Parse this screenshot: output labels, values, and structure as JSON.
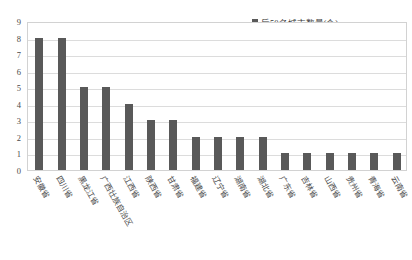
{
  "legend": {
    "entries": [
      {
        "label": "后50名城市数量(个)",
        "color": "#595959",
        "marker": "square-swatch"
      }
    ]
  },
  "axes": {
    "y_ticks": [
      "0",
      "1",
      "2",
      "3",
      "4",
      "5",
      "6",
      "7",
      "8",
      "9"
    ],
    "y_min": 0,
    "y_max": 9,
    "y_step": 1
  },
  "chart_data": {
    "type": "bar",
    "title": "",
    "subtitle": "",
    "xlabel": "",
    "ylabel": "",
    "ylim": [
      0,
      9
    ],
    "ytick_step": 1,
    "grid": true,
    "legend_position": "top-right",
    "bar_color": "#595959",
    "plot_border_color": "#d2d2d2",
    "gridline_color": "#dcdcdc",
    "xtick_label_rotation": 60,
    "categories": [
      "安徽省",
      "四川省",
      "黑龙江省",
      "广西壮族自治区",
      "江西省",
      "陕西省",
      "甘肃省",
      "福建省",
      "辽宁省",
      "湖南省",
      "湖北省",
      "广东省",
      "吉林省",
      "山西省",
      "贵州省",
      "青海省",
      "云南省"
    ],
    "series": [
      {
        "name": "后50名城市数量(个)",
        "values": [
          8,
          8,
          5,
          5,
          4,
          3,
          3,
          2,
          2,
          2,
          2,
          1,
          1,
          1,
          1,
          1,
          1
        ]
      }
    ]
  }
}
